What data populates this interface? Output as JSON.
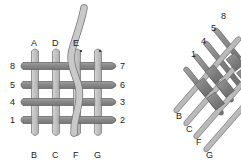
{
  "figure": {
    "title": "",
    "background_color": "#ffffff",
    "dark_strand_color": "#898989",
    "light_strand_color": "#c8c8c8",
    "outline_color": "#555555",
    "label_color": "#1a1a1a",
    "dot_color": "#3b3b3b"
  },
  "left_diagram": {
    "name": "orthogonal-weave-grid",
    "top_labels": [
      "A",
      "D",
      "E"
    ],
    "bottom_labels": [
      "B",
      "C",
      "F",
      "G"
    ],
    "left_labels": [
      "8",
      "5",
      "4",
      "1"
    ],
    "right_labels": [
      "7",
      "6",
      "3",
      "2"
    ],
    "horizontal_strand_count": 4,
    "vertical_strand_count": 4,
    "free_strand_label": "",
    "markers": [
      "dot",
      "dot"
    ]
  },
  "right_diagram": {
    "name": "diagonal-weave-grid",
    "top_labels": [
      "1",
      "4",
      "5",
      "8"
    ],
    "bottom_labels": [
      "B",
      "C",
      "F",
      "G"
    ],
    "strand_count_per_direction": 4
  }
}
